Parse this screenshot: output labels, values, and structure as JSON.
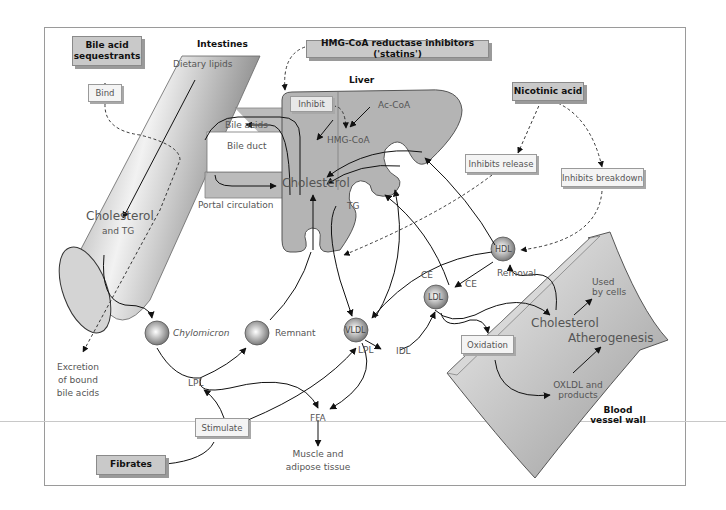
{
  "diagram": {
    "title_regions": {
      "intestines": "Intestines",
      "liver": "Liver",
      "blood_vessel_wall": [
        "Blood",
        "vessel wall"
      ]
    },
    "drugs": {
      "bile_acid_sequestrants": [
        "Bile acid",
        "sequestrants"
      ],
      "statins": "HMG-CoA reductase inhibitors ('statins')",
      "nicotinic_acid": "Nicotinic acid",
      "fibrates": "Fibrates"
    },
    "actions": {
      "bind": "Bind",
      "inhibit": "Inhibit",
      "inhibits_release": "Inhibits release",
      "inhibits_breakdown": "Inhibits breakdown",
      "stimulate": "Stimulate",
      "oxidation": "Oxidation"
    },
    "labels": {
      "dietary_lipids": "Dietary lipids",
      "bile_acids": "Bile acids",
      "bile_duct": "Bile duct",
      "portal_circulation": "Portal circulation",
      "cholesterol_liver": "Cholesterol",
      "ac_coa": "Ac-CoA",
      "hmg_coa": "HMG-CoA",
      "tg": "TG",
      "cholesterol_intestine": "Cholesterol",
      "and_tg": "and TG",
      "excretion": [
        "Excretion",
        "of bound",
        "bile acids"
      ],
      "chylomicron": "Chylomicron",
      "remnant": "Remnant",
      "lpl_left": "LPL",
      "lpl_right": "LPL",
      "vldl": "VLDL",
      "idl": "IDL",
      "ldl": "LDL",
      "hdl": "HDL",
      "ce_left": "CE",
      "ce_right": "CE",
      "removal": "Removal",
      "ffa": "FFA",
      "muscle": [
        "Muscle and",
        "adipose tissue"
      ],
      "cholesterol_vessel": "Cholesterol",
      "used_by_cells": [
        "Used",
        "by cells"
      ],
      "atherogenesis": "Atherogenesis",
      "oxldl": [
        "OXLDL and",
        "products"
      ]
    },
    "colors": {
      "liver_fill": "#b4b4b4",
      "drug_box": "#c9c9c9",
      "action_box": "#f4f4f4",
      "line": "#222222",
      "text": "#555555"
    }
  }
}
